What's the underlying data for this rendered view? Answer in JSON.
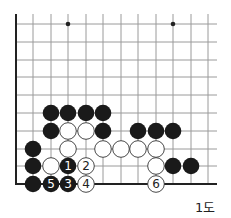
{
  "diagram": {
    "type": "go-board-corner",
    "caption": "1도",
    "colors": {
      "black": "#1a1a1a",
      "white": "#ffffff",
      "grid": "#9a9a9a",
      "edge": "#222222"
    },
    "grid": {
      "columns_x": [
        16,
        33,
        51,
        68,
        86,
        103,
        121,
        138,
        156,
        173,
        191,
        208
      ],
      "rows_y": [
        24,
        42,
        60,
        77,
        95,
        113,
        131,
        149,
        166,
        184
      ],
      "left_edge": true,
      "bottom_edge": true
    },
    "star_points": [
      {
        "x": 68,
        "y": 24
      },
      {
        "x": 173,
        "y": 24
      }
    ],
    "stones": [
      {
        "color": "black",
        "x": 51,
        "y": 113
      },
      {
        "color": "black",
        "x": 68,
        "y": 113
      },
      {
        "color": "black",
        "x": 86,
        "y": 113
      },
      {
        "color": "black",
        "x": 103,
        "y": 113
      },
      {
        "color": "black",
        "x": 51,
        "y": 131
      },
      {
        "color": "white",
        "x": 68,
        "y": 131
      },
      {
        "color": "white",
        "x": 86,
        "y": 131
      },
      {
        "color": "black",
        "x": 103,
        "y": 131
      },
      {
        "color": "black",
        "x": 138,
        "y": 131
      },
      {
        "color": "black",
        "x": 156,
        "y": 131
      },
      {
        "color": "black",
        "x": 173,
        "y": 131
      },
      {
        "color": "black",
        "x": 33,
        "y": 149
      },
      {
        "color": "white",
        "x": 68,
        "y": 149
      },
      {
        "color": "white",
        "x": 103,
        "y": 149
      },
      {
        "color": "white",
        "x": 121,
        "y": 149
      },
      {
        "color": "white",
        "x": 138,
        "y": 149
      },
      {
        "color": "white",
        "x": 156,
        "y": 149
      },
      {
        "color": "black",
        "x": 33,
        "y": 166
      },
      {
        "color": "white",
        "x": 51,
        "y": 166
      },
      {
        "color": "black",
        "x": 68,
        "y": 166,
        "label": "1"
      },
      {
        "color": "white",
        "x": 86,
        "y": 166,
        "label": "2"
      },
      {
        "color": "white",
        "x": 156,
        "y": 166
      },
      {
        "color": "black",
        "x": 173,
        "y": 166
      },
      {
        "color": "black",
        "x": 191,
        "y": 166
      },
      {
        "color": "black",
        "x": 33,
        "y": 184
      },
      {
        "color": "black",
        "x": 51,
        "y": 184,
        "label": "5"
      },
      {
        "color": "black",
        "x": 68,
        "y": 184,
        "label": "3"
      },
      {
        "color": "white",
        "x": 86,
        "y": 184,
        "label": "4"
      },
      {
        "color": "white",
        "x": 156,
        "y": 184,
        "label": "6"
      }
    ]
  }
}
